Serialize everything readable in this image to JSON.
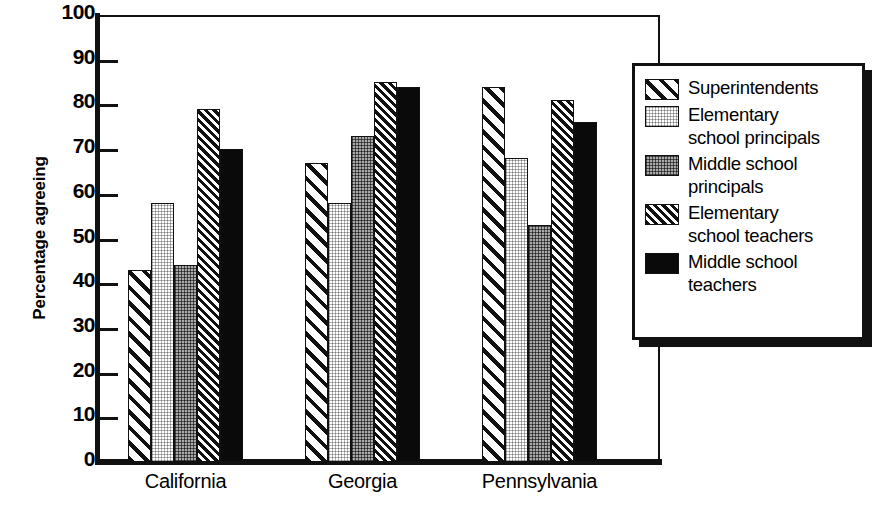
{
  "chart_data": {
    "type": "bar",
    "title": "",
    "xlabel": "",
    "ylabel": "Percentage agreeing",
    "ylim": [
      0,
      100
    ],
    "yticks": [
      0,
      10,
      20,
      30,
      40,
      50,
      60,
      70,
      80,
      90,
      100
    ],
    "grid": false,
    "legend_position": "right",
    "categories": [
      "California",
      "Georgia",
      "Pennsylvania"
    ],
    "series": [
      {
        "name": "Superintendents",
        "pattern": "diagonal-wide-hatch",
        "values": [
          43,
          67,
          84
        ]
      },
      {
        "name": "Elementary school principals",
        "pattern": "light-stipple",
        "values": [
          58,
          58,
          68
        ]
      },
      {
        "name": "Middle school principals",
        "pattern": "gray-stipple",
        "values": [
          44,
          73,
          53
        ]
      },
      {
        "name": "Elementary school teachers",
        "pattern": "diagonal-dense-hatch",
        "values": [
          79,
          85,
          81
        ]
      },
      {
        "name": "Middle school teachers",
        "pattern": "solid-black",
        "values": [
          70,
          84,
          76
        ]
      }
    ]
  },
  "legend": {
    "items": [
      {
        "label": "Superintendents"
      },
      {
        "label": "Elementary\nschool principals"
      },
      {
        "label": "Middle school\nprincipals"
      },
      {
        "label": "Elementary\nschool teachers"
      },
      {
        "label": "Middle school\nteachers"
      }
    ]
  },
  "colors": {
    "ink": "#111111",
    "paper": "#ffffff",
    "gray_fill": "#a9a9a9",
    "black_fill": "#0a0a0a"
  }
}
